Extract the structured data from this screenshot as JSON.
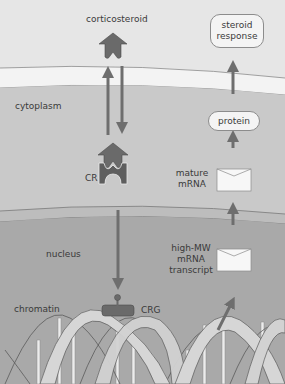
{
  "diagram": {
    "regions": {
      "extracellular": "extracellular",
      "cytoplasm": "cytoplasm",
      "nucleus": "nucleus",
      "chromatin": "chromatin"
    },
    "labels": {
      "corticosteroid": "corticosteroid",
      "receptor": "CR",
      "gene": "CRG",
      "mature_mrna_1": "mature",
      "mature_mrna_2": "mRNA",
      "transcript_1": "high-MW",
      "transcript_2": "mRNA",
      "transcript_3": "transcript"
    },
    "boxes": {
      "protein": "protein",
      "steroid_response_1": "steroid",
      "steroid_response_2": "response"
    },
    "colors": {
      "extracellular_bg": "#e6e6e6",
      "membrane_fill": "#f2f2f2",
      "cytoplasm_bg": "#c9c9c9",
      "nucleus_bg": "#a9a9a9",
      "arrow": "#6e6e6e",
      "receptor": "#6a6a6a",
      "dna_strand": "#cfcfcf"
    }
  }
}
